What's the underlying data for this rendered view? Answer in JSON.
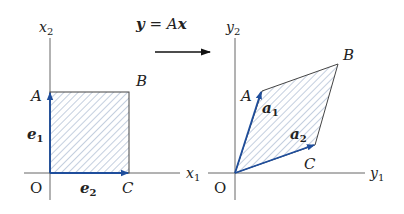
{
  "title": {
    "equation": "y = Ax",
    "eq_y": "y",
    "eq_eq": " = ",
    "eq_A": "A",
    "eq_x": "x"
  },
  "colors": {
    "axis": "#555555",
    "vector": "#1f4e9c",
    "hatch": "#8aa0c0",
    "shape_edge": "#444444"
  },
  "left": {
    "x_axis_label": "x",
    "x_axis_sub": "1",
    "y_axis_label": "x",
    "y_axis_sub": "2",
    "origin": "O",
    "point_A": "A",
    "point_B": "B",
    "point_C": "C",
    "vec1": "e",
    "vec1_sub": "1",
    "vec2": "e",
    "vec2_sub": "2"
  },
  "right": {
    "x_axis_label": "y",
    "x_axis_sub": "1",
    "y_axis_label": "y",
    "y_axis_sub": "2",
    "origin": "O",
    "point_A": "A",
    "point_B": "B",
    "point_C": "C",
    "vec1": "a",
    "vec1_sub": "1",
    "vec2": "a",
    "vec2_sub": "2"
  }
}
